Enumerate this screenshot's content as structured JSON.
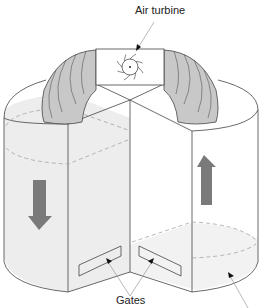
{
  "diagram": {
    "type": "tidal power station - twin basin with air turbine",
    "labels": {
      "air_turbine": "Air turbine",
      "gates": "Gates"
    },
    "components": [
      {
        "name": "left-basin",
        "flow": "down"
      },
      {
        "name": "right-basin",
        "flow": "up"
      },
      {
        "name": "air-duct-arch",
        "connects": [
          "left-basin",
          "right-basin"
        ]
      },
      {
        "name": "air-turbine",
        "location": "top of duct"
      },
      {
        "name": "gate-left"
      },
      {
        "name": "gate-right"
      }
    ],
    "colors": {
      "duct": "#c8c8c8",
      "arrow": "#7a7a7a",
      "water": "#ededed",
      "outline": "#444444",
      "leader": "#999999"
    }
  }
}
